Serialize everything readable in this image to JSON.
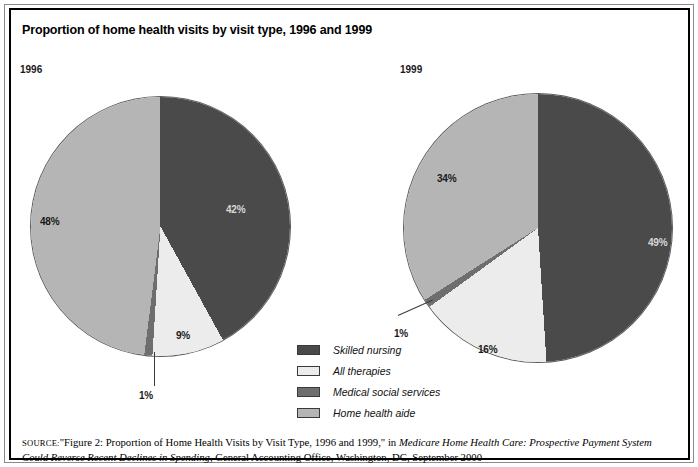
{
  "figure": {
    "title": "Proportion of home health visits by visit type, 1996 and 1999"
  },
  "panels": {
    "left_year": "1996",
    "right_year": "1999"
  },
  "legend": {
    "items": [
      {
        "label": "Skilled nursing",
        "color": "#4a4a4a"
      },
      {
        "label": "All therapies",
        "color": "#ececec"
      },
      {
        "label": "Medical social services",
        "color": "#6e6e6e"
      },
      {
        "label": "Home health aide",
        "color": "#b5b5b5"
      }
    ]
  },
  "labels": {
    "y1996": {
      "skilled_nursing": "42%",
      "all_therapies": "9%",
      "medical_social_services": "1%",
      "home_health_aide": "48%"
    },
    "y1999": {
      "skilled_nursing": "49%",
      "all_therapies": "16%",
      "medical_social_services": "1%",
      "home_health_aide": "34%"
    }
  },
  "source": {
    "prefix": "SOURCE:",
    "text_1": "\"Figure 2: Proportion of Home Health Visits by Visit Type, 1996 and 1999,\" in ",
    "italic_title": "Medicare Home Health Care: Prospective Payment System Could Reverse Recent Declines in Spending",
    "text_2": ", General Accounting Office, Washington, DC, September 2000"
  },
  "chart_data": {
    "type": "pie",
    "title": "Proportion of home health visits by visit type, 1996 and 1999",
    "value_unit": "percent",
    "legend_position": "center-bottom",
    "categories": [
      "Skilled nursing",
      "All therapies",
      "Medical social services",
      "Home health aide"
    ],
    "colors": [
      "#4a4a4a",
      "#ececec",
      "#6e6e6e",
      "#b5b5b5"
    ],
    "panels": [
      {
        "name": "1996",
        "start_angle_deg": 0,
        "direction": "clockwise",
        "values": [
          42,
          9,
          1,
          48
        ],
        "labels": [
          "42%",
          "9%",
          "1%",
          "48%"
        ]
      },
      {
        "name": "1999",
        "start_angle_deg": 0,
        "direction": "clockwise",
        "values": [
          49,
          16,
          1,
          34
        ],
        "labels": [
          "49%",
          "16%",
          "1%",
          "34%"
        ]
      }
    ]
  }
}
